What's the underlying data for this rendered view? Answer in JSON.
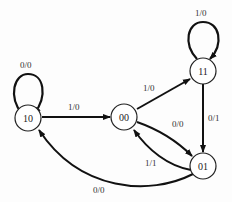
{
  "diagram": {
    "type": "state-diagram",
    "nodes": [
      {
        "id": "10",
        "label": "10"
      },
      {
        "id": "00",
        "label": "00"
      },
      {
        "id": "11",
        "label": "11"
      },
      {
        "id": "01",
        "label": "01"
      }
    ],
    "edges": [
      {
        "from": "10",
        "to": "10",
        "label": "0/0"
      },
      {
        "from": "10",
        "to": "00",
        "label": "1/0"
      },
      {
        "from": "00",
        "to": "11",
        "label": "1/0"
      },
      {
        "from": "11",
        "to": "11",
        "label": "1/0"
      },
      {
        "from": "11",
        "to": "01",
        "label": "0/1"
      },
      {
        "from": "00",
        "to": "01",
        "label": "0/0"
      },
      {
        "from": "01",
        "to": "00",
        "label": "1/1"
      },
      {
        "from": "01",
        "to": "10",
        "label": "0/0"
      }
    ]
  }
}
